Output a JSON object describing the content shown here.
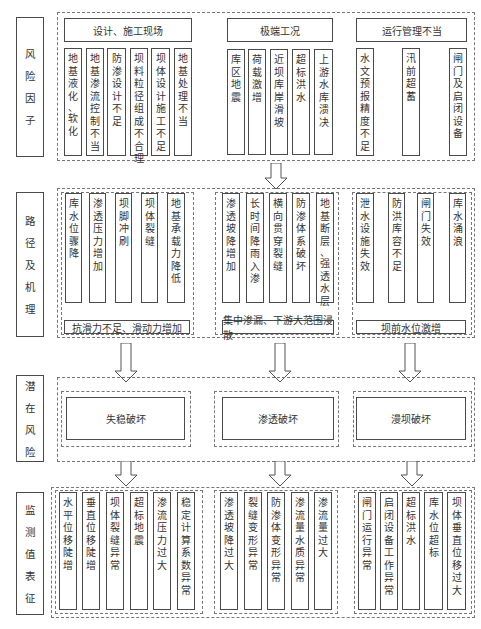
{
  "row_labels": {
    "risk_factors": "风险因子",
    "paths": "路径及机理",
    "potential_risks": "潜在风险",
    "monitoring": "监测值表征"
  },
  "risk_factors": {
    "groups": [
      {
        "title": "设计、施工现场",
        "items": [
          "地基液化、软化",
          "地基渗流控制不当",
          "防渗设计不足",
          "坝料粒径组成不合理",
          "坝体设计施工不足",
          "地基处理不当"
        ]
      },
      {
        "title": "极端工况",
        "items": [
          "库区地震",
          "荷载激增",
          "近坝库岸滑坡",
          "超标洪水",
          "上游水库溃决"
        ]
      },
      {
        "title": "运行管理不当",
        "items": [
          "水文预报精度不足",
          "汛前超蓄",
          "闸门及启闭设备"
        ]
      }
    ]
  },
  "paths": {
    "groups": [
      {
        "items": [
          "库水位骤降",
          "渗透压力增加",
          "坝脚冲刷",
          "坝体裂缝",
          "地基承载力降低"
        ],
        "result": "抗滑力不足、滑动力增加"
      },
      {
        "items": [
          "渗透坡降增加",
          "长时间降雨入渗",
          "横向贯穿裂缝",
          "防渗体系破坏",
          "地基断层、强透水层"
        ],
        "result": "集中渗漏、下游大范围浸散"
      },
      {
        "items": [
          "泄水设施失效",
          "防洪库容不足",
          "闸门失效",
          "库水涌浪"
        ],
        "result": "坝前水位激增"
      }
    ]
  },
  "potential_risks": {
    "items": [
      "失稳破坏",
      "渗透破坏",
      "漫坝破坏"
    ]
  },
  "monitoring": {
    "groups": [
      {
        "items": [
          "水平位移陡增",
          "垂直位移陡增",
          "坝体裂缝异常",
          "超标地震",
          "渗流压力过大",
          "稳定计算系数异常"
        ]
      },
      {
        "items": [
          "渗透坡降过大",
          "裂缝变形异常",
          "防渗体变形异常",
          "渗流量水质异常",
          "渗流量过大"
        ]
      },
      {
        "items": [
          "闸门运行异常",
          "启闭设备工作异常",
          "超标洪水",
          "库水位超标",
          "坝体垂直位移过大"
        ]
      }
    ]
  },
  "colors": {
    "line": "#4a4a4a",
    "dash": "#777777",
    "background": "#ffffff"
  }
}
